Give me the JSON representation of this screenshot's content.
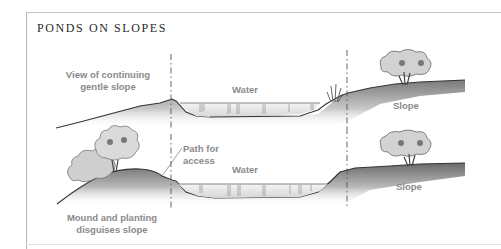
{
  "title": "PONDS ON SLOPES",
  "top_section": {
    "left_label_line1": "View of continuing",
    "left_label_line2": "gentle slope",
    "water_label": "Water",
    "right_label": "Slope"
  },
  "bottom_section": {
    "left_label_line1": "Mound and planting",
    "left_label_line2": "disguises slope",
    "path_label_line1": "Path for",
    "path_label_line2": "access",
    "water_label": "Water",
    "right_label": "Slope"
  },
  "colors": {
    "label_gray": "#8a8a8a",
    "title": "#2a2a2a",
    "ground_dark": "#555555",
    "ground_light": "#f0f0f0",
    "water": "#e8e8e8",
    "foliage": "#d8d8d8"
  }
}
